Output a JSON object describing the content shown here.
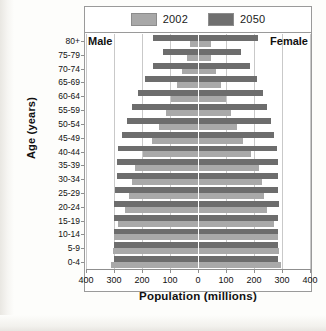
{
  "figure": {
    "male_label": "Male",
    "female_label": "Female"
  },
  "legend": {
    "items": [
      {
        "label": "2002",
        "color": "#a9a9a9"
      },
      {
        "label": "2050",
        "color": "#6d6d6d"
      }
    ]
  },
  "chart_data": {
    "type": "bar",
    "subtype": "population-pyramid",
    "title": "",
    "xlabel": "Population (millions)",
    "ylabel": "Age (years)",
    "orientation": "horizontal",
    "grid": true,
    "legend_position": "top",
    "xlim": [
      -400,
      400
    ],
    "xticks": [
      -400,
      -300,
      -200,
      -100,
      0,
      100,
      200,
      300,
      400
    ],
    "xticklabels": [
      "400",
      "300",
      "200",
      "100",
      "0",
      "100",
      "200",
      "300",
      "400"
    ],
    "xtick_unit": "millions",
    "categories": [
      "0-4",
      "5-9",
      "10-14",
      "15-19",
      "20-24",
      "25-29",
      "30-34",
      "35-39",
      "40-44",
      "45-49",
      "50-54",
      "55-59",
      "60-64",
      "65-69",
      "70-74",
      "75-79",
      "80+"
    ],
    "category_order_top_to_bottom": [
      "80+",
      "75-79",
      "70-74",
      "65-69",
      "60-64",
      "55-59",
      "50-54",
      "45-49",
      "40-44",
      "35-39",
      "30-34",
      "25-29",
      "20-24",
      "15-19",
      "10-14",
      "5-9",
      "0-4"
    ],
    "series": [
      {
        "name": "2002",
        "color": "#a9a9a9",
        "male": [
          310,
          305,
          300,
          285,
          260,
          245,
          235,
          225,
          195,
          165,
          140,
          115,
          95,
          75,
          58,
          38,
          30
        ],
        "female": [
          295,
          290,
          285,
          270,
          248,
          236,
          228,
          218,
          190,
          162,
          140,
          118,
          100,
          82,
          66,
          48,
          45
        ]
      },
      {
        "name": "2050",
        "color": "#6d6d6d",
        "male": [
          300,
          300,
          300,
          300,
          300,
          295,
          290,
          290,
          285,
          270,
          255,
          235,
          215,
          190,
          160,
          125,
          160
        ],
        "female": [
          285,
          285,
          285,
          285,
          288,
          285,
          285,
          285,
          282,
          272,
          262,
          248,
          232,
          212,
          185,
          152,
          215
        ]
      }
    ]
  }
}
